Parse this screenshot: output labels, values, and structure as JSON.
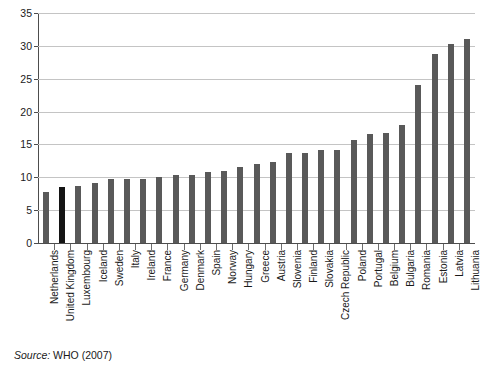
{
  "chart_data": {
    "type": "bar",
    "title": "",
    "subtitle": "",
    "xlabel": "",
    "ylabel": "",
    "ylim": [
      0,
      35
    ],
    "ytick_step": 5,
    "yticks": [
      0,
      5,
      10,
      15,
      20,
      25,
      30,
      35
    ],
    "ytick_labels": [
      "0",
      "5",
      "10",
      "15",
      "20",
      "25",
      "30",
      "35"
    ],
    "grid": true,
    "grid_axis": "y",
    "legend": false,
    "legend_position": "none",
    "orientation": "vertical",
    "sorted": "ascending",
    "categories": [
      "Netherlands",
      "United Kingdom",
      "Luxembourg",
      "Iceland",
      "Sweden",
      "Italy",
      "Ireland",
      "France",
      "Germany",
      "Denmark",
      "Spain",
      "Norway",
      "Hungary",
      "Greece",
      "Austria",
      "Slovenia",
      "Finland",
      "Slovakia",
      "Czech Republic",
      "Poland",
      "Portugal",
      "Belgium",
      "Bulgaria",
      "Romania",
      "Estonia",
      "Latvia",
      "Lithuania"
    ],
    "values": [
      7.7,
      8.5,
      8.7,
      9.2,
      9.8,
      9.8,
      9.8,
      10.1,
      10.4,
      10.4,
      10.8,
      10.9,
      11.5,
      12.0,
      12.3,
      13.7,
      13.7,
      14.1,
      14.1,
      15.7,
      16.6,
      16.7,
      17.9,
      24.1,
      28.8,
      30.3,
      31.1
    ],
    "highlight_index": 1,
    "highlight_category": "United Kingdom",
    "colors": {
      "bar": "#595959",
      "bar_highlight": "#141414",
      "gridline": "#c4c4c4",
      "axis": "#4d4d4d",
      "background": "#ffffff",
      "text": "#1a1a1a"
    }
  },
  "footer": {
    "source_label": "Source:",
    "source_value": "WHO (2007)"
  }
}
